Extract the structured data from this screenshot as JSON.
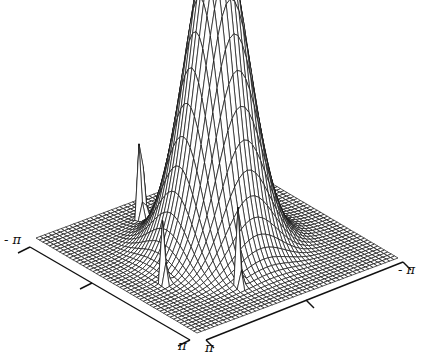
{
  "chart_data": {
    "type": "surface3d",
    "title": "",
    "x_axis": {
      "range": [
        "-π",
        "π"
      ],
      "tick_labels": [
        "- π",
        "π"
      ]
    },
    "y_axis": {
      "range": [
        "π",
        "-π"
      ],
      "tick_labels": [
        "π",
        "- π"
      ]
    },
    "z_axis": {
      "visible": false
    },
    "grid": true,
    "legend": null,
    "surface": {
      "function": "gaussian peak plus narrow spikes",
      "peak": {
        "x": 0,
        "y": 0,
        "height": 1.0,
        "width_sigma": 0.75
      },
      "spikes": [
        {
          "x": -2.2,
          "y": 0.6,
          "height": 0.38,
          "width_sigma": 0.06
        },
        {
          "x": 0.7,
          "y": 2.2,
          "height": 0.32,
          "width_sigma": 0.05
        },
        {
          "x": 2.0,
          "y": 0.9,
          "height": 0.32,
          "width_sigma": 0.05
        }
      ],
      "mesh_resolution": 48
    }
  },
  "labels": {
    "x_min": "- π",
    "x_max": "π",
    "y_max": "π",
    "y_min": "- π"
  },
  "colors": {
    "line": "#111111",
    "background": "#ffffff"
  }
}
